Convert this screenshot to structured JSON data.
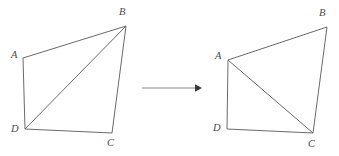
{
  "figure": {
    "stroke_color": "#6b6b6b",
    "arrow_color": "#8a8a8a",
    "label_color": "#4a4a4a",
    "background": "#ffffff"
  },
  "left_shape": {
    "name": "quadrilateral-abcd-left",
    "diagonal": "DB",
    "vertices": [
      {
        "id": "A",
        "label": "A",
        "x": 23,
        "y": 58,
        "label_x": 11,
        "label_y": 50
      },
      {
        "id": "B",
        "label": "B",
        "x": 126,
        "y": 26,
        "label_x": 119,
        "label_y": 7
      },
      {
        "id": "C",
        "label": "C",
        "x": 112,
        "y": 133,
        "label_x": 107,
        "label_y": 138
      },
      {
        "id": "D",
        "label": "D",
        "x": 25,
        "y": 129,
        "label_x": 11,
        "label_y": 124
      }
    ],
    "edge_path": "M 23 58 L 126 26 L 112 133 L 25 129 Z",
    "diagonal_path": "M 25 129 L 126 26"
  },
  "right_shape": {
    "name": "quadrilateral-abcd-right",
    "diagonal": "AC",
    "vertices": [
      {
        "id": "A",
        "label": "A",
        "x": 228,
        "y": 60,
        "label_x": 215,
        "label_y": 51
      },
      {
        "id": "B",
        "label": "B",
        "x": 327,
        "y": 27,
        "label_x": 319,
        "label_y": 8
      },
      {
        "id": "C",
        "label": "C",
        "x": 313,
        "y": 133,
        "label_x": 308,
        "label_y": 139
      },
      {
        "id": "D",
        "label": "D",
        "x": 227,
        "y": 129,
        "label_x": 213,
        "label_y": 123
      }
    ],
    "edge_path": "M 228 60 L 327 27 L 313 133 L 227 129 Z",
    "diagonal_path": "M 228 60 L 313 133"
  },
  "arrow": {
    "name": "transformation-arrow",
    "line_path": "M 142 88 L 196 88",
    "head_path": "M 195 84.2 L 202 88 L 195 91.8 Z"
  }
}
